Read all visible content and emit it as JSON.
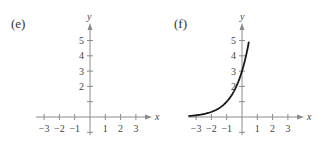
{
  "chart_data": [
    {
      "type": "line",
      "panel_label": "(e)",
      "xlabel": "x",
      "ylabel": "y",
      "xlim": [
        -3.5,
        3.6
      ],
      "ylim": [
        -1,
        5.7
      ],
      "x_ticks": [
        -3,
        -2,
        -1,
        1,
        2,
        3
      ],
      "x_tick_labels": [
        "−3",
        "−2",
        "−1",
        "1",
        "2",
        "3"
      ],
      "y_ticks": [
        1,
        2,
        3,
        4,
        5
      ],
      "y_tick_labels": [
        "",
        "2",
        "3",
        "4",
        "5"
      ],
      "grid": false,
      "series": [
        {
          "name": "decreasing exponential",
          "x": [
            -3.5,
            -3,
            -2,
            -1,
            0,
            1,
            2,
            3,
            3.5
          ],
          "y": [
            5.5,
            4.4,
            2.6,
            1.6,
            1.0,
            0.62,
            0.38,
            0.24,
            0.18
          ]
        }
      ]
    },
    {
      "type": "line",
      "panel_label": "(f)",
      "xlabel": "x",
      "ylabel": "y",
      "xlim": [
        -3.5,
        3.6
      ],
      "ylim": [
        -1,
        5.7
      ],
      "x_ticks": [
        -3,
        -2,
        -1,
        1,
        2,
        3
      ],
      "x_tick_labels": [
        "−3",
        "−2",
        "−1",
        "1",
        "2",
        "3"
      ],
      "y_ticks": [
        1,
        2,
        3,
        4,
        5
      ],
      "y_tick_labels": [
        "",
        "2",
        "3",
        "4",
        "5"
      ],
      "grid": false,
      "series": [
        {
          "name": "increasing exponential",
          "x": [
            -3.5,
            -3,
            -2,
            -1.5,
            -1,
            -0.5,
            0,
            0.25,
            0.45
          ],
          "y": [
            0.01,
            0.04,
            0.11,
            0.19,
            0.33,
            0.58,
            1.0,
            1.73,
            1.9
          ]
        }
      ]
    }
  ],
  "panels": {
    "e": {
      "label": "(e)",
      "x_axis_label": "x",
      "y_axis_label": "y"
    },
    "f": {
      "label": "(f)",
      "x_axis_label": "x",
      "y_axis_label": "y"
    }
  }
}
